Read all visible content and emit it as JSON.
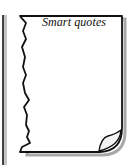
{
  "figure": {
    "page_label": "Smart quotes",
    "colors": {
      "outline": "#111111",
      "shadow": "#9a9a9a",
      "paper": "#ffffff"
    }
  }
}
